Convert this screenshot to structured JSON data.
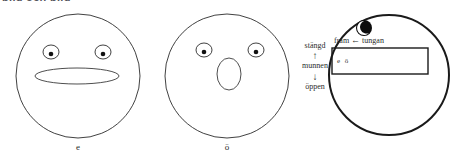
{
  "heading_cut": "bild och bild",
  "figures": [
    {
      "name": "face-e",
      "label": "e",
      "mouth_shape": "wide-flat-ellipse",
      "eyes": 2
    },
    {
      "name": "face-o-umlaut",
      "label": "ö",
      "mouth_shape": "small-round-ellipse",
      "eyes": 2
    }
  ],
  "vowel_diagram": {
    "mouth_axis": {
      "closed_label": "stängd",
      "up_arrow": "↑",
      "axis_label": "munnen",
      "down_arrow": "↓",
      "open_label": "öppen"
    },
    "tongue_axis": {
      "front_label": "fram",
      "arrow": "←",
      "axis_label": "tungan"
    },
    "cell_vowels": "e ö",
    "eye": "single-eye-top-left"
  },
  "colors": {
    "stroke": "#2b2b2b",
    "thick_stroke": "#1a1a1a",
    "text": "#2b2b2b",
    "heading": "#55555d",
    "background": "#ffffff"
  }
}
